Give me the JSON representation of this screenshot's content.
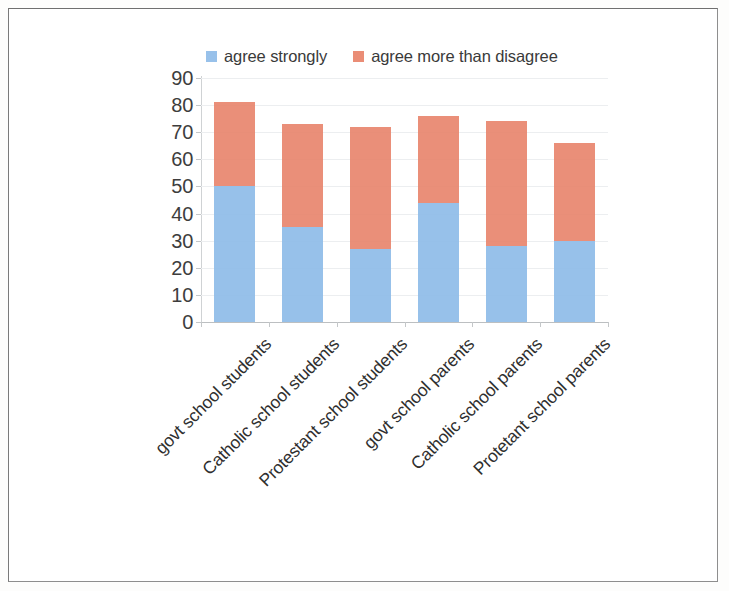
{
  "chart_data": {
    "type": "bar",
    "subtype": "stacked-bar",
    "title": "",
    "xlabel": "",
    "ylabel": "",
    "ylim": [
      0,
      90
    ],
    "ytick_step": 10,
    "ytick_labels": [
      "90",
      "80",
      "70",
      "60",
      "50",
      "40",
      "30",
      "20",
      "10",
      "0"
    ],
    "grid": true,
    "legend_position": "top",
    "categories": [
      "govt school students",
      "Catholic school students",
      "Protestant school students",
      "govt school parents",
      "Catholic school parents",
      "Protetant school parents"
    ],
    "series": [
      {
        "name": "agree strongly",
        "color": "#8FBCE8",
        "values": [
          50,
          35,
          27,
          44,
          28,
          30
        ]
      },
      {
        "name": "agree more than disagree",
        "color": "#E8836A",
        "values": [
          31,
          38,
          45,
          32,
          46,
          36
        ]
      }
    ],
    "totals": [
      81,
      73,
      72,
      76,
      74,
      66
    ]
  },
  "legend": {
    "items": [
      {
        "label": "agree strongly",
        "color": "#8FBCE8",
        "swatch": "legend-swatch-blue"
      },
      {
        "label": "agree more than disagree",
        "color": "#E8836A",
        "swatch": "legend-swatch-orange"
      }
    ]
  },
  "axis": {
    "y_labels": [
      "90",
      "80",
      "70",
      "60",
      "50",
      "40",
      "30",
      "20",
      "10",
      "0"
    ]
  },
  "colors": {
    "agree_strongly": "#8FBCE8",
    "agree_more_than_disagree": "#E8836A",
    "gridline": "#eceef0",
    "axis": "#c4c7c9",
    "text": "#333333",
    "frame": "#8e8e8e",
    "background": "#ffffff"
  }
}
